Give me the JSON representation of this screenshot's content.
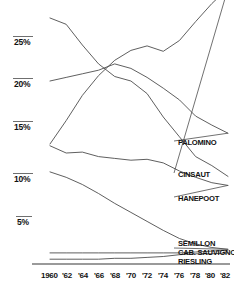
{
  "chart_data": {
    "type": "line",
    "title": "",
    "subtitle": "",
    "xlabel": "",
    "ylabel": "",
    "grid": false,
    "legend_position": "right-of-lines",
    "x": [
      1960,
      1962,
      1964,
      1966,
      1968,
      1970,
      1972,
      1974,
      1976,
      1978,
      1980,
      1982
    ],
    "x_tick_labels": [
      "1960",
      "'62",
      "'64",
      "'66",
      "'68",
      "'70",
      "'72",
      "'74",
      "'76",
      "'78",
      "'80",
      "'82"
    ],
    "y_tick_labels": [
      "25%",
      "20%",
      "15%",
      "10%",
      "5%"
    ],
    "y_tick_values": [
      25,
      20,
      15,
      10,
      5
    ],
    "ylim": [
      0,
      30
    ],
    "xlim": [
      1960,
      1982
    ],
    "series": [
      {
        "name": "CHENIN BLANC",
        "label": "",
        "values": [
          27.0,
          26.3,
          24.0,
          21.9,
          20.5,
          20.0,
          18.6,
          16.0,
          13.8,
          11.6,
          10.6,
          9.4
        ]
      },
      {
        "name": "PALOMINO",
        "label": "PALOMINO",
        "values": [
          20.0,
          20.4,
          20.8,
          21.2,
          21.9,
          21.4,
          20.4,
          19.2,
          17.9,
          16.1,
          15.1,
          14.2
        ]
      },
      {
        "name": "CINSAUT",
        "label": "CINSAUT",
        "values": [
          13.0,
          15.6,
          18.4,
          20.6,
          22.3,
          23.4,
          23.9,
          23.3,
          24.5,
          26.6,
          28.6,
          30.3
        ]
      },
      {
        "name": "HANEPOOT",
        "label": "HANEPOOT",
        "values": [
          12.8,
          12.0,
          12.1,
          11.6,
          11.4,
          11.2,
          11.3,
          10.9,
          10.0,
          9.3,
          8.7,
          8.4
        ]
      },
      {
        "name": "SEMILLON",
        "label": "SEMILLON",
        "values": [
          9.9,
          9.3,
          8.5,
          7.5,
          6.4,
          5.4,
          4.4,
          3.4,
          2.5,
          1.9,
          1.5,
          1.3
        ]
      },
      {
        "name": "CAB. SAUVIGNON",
        "label": "CAB. SAUVIGNON",
        "values": [
          0.9,
          0.9,
          0.9,
          0.9,
          0.9,
          0.9,
          0.9,
          0.9,
          0.9,
          1.0,
          1.1,
          1.2
        ]
      },
      {
        "name": "RIESLING",
        "label": "RIESLING",
        "values": [
          0.2,
          0.2,
          0.2,
          0.2,
          0.3,
          0.3,
          0.4,
          0.5,
          0.7,
          0.8,
          0.8,
          0.9
        ]
      }
    ],
    "line_color": "#4d4d4d",
    "axis_color": "#9a9a9a",
    "text_color": "#111111"
  },
  "ytick_positions": [
    {
      "label": "25%",
      "top": 38,
      "rule_top": 36,
      "rule_left": 13,
      "rule_width": 20
    },
    {
      "label": "20%",
      "top": 80,
      "rule_top": 78,
      "rule_left": 13,
      "rule_width": 20
    },
    {
      "label": "15%",
      "top": 123,
      "rule_top": 121,
      "rule_left": 13,
      "rule_width": 20
    },
    {
      "label": "10%",
      "top": 175,
      "rule_top": 173,
      "rule_left": 13,
      "rule_width": 20
    },
    {
      "label": "5%",
      "top": 218,
      "rule_top": 216,
      "rule_left": 16,
      "rule_width": 16
    }
  ],
  "xtick_positions": [
    {
      "label": "1960",
      "left": 41
    },
    {
      "label": "'62",
      "left": 62
    },
    {
      "label": "'64",
      "left": 78
    },
    {
      "label": "'66",
      "left": 94
    },
    {
      "label": "'68",
      "left": 110
    },
    {
      "label": "'70",
      "left": 126
    },
    {
      "label": "'72",
      "left": 142
    },
    {
      "label": "'74",
      "left": 158
    },
    {
      "label": "'76",
      "left": 174
    },
    {
      "label": "'78",
      "left": 190
    },
    {
      "label": "'80",
      "left": 205
    },
    {
      "label": "'82",
      "left": 220
    }
  ],
  "series_labels": [
    {
      "name": "PALOMINO",
      "left": 178,
      "top": 138
    },
    {
      "name": "CINSAUT",
      "left": 178,
      "top": 170
    },
    {
      "name": "HANEPOOT",
      "left": 178,
      "top": 194
    },
    {
      "name": "SEMILLON",
      "left": 178,
      "top": 239
    },
    {
      "name": "CAB. SAUVIGNON",
      "left": 178,
      "top": 248
    },
    {
      "name": "RIESLING",
      "left": 178,
      "top": 257
    }
  ]
}
